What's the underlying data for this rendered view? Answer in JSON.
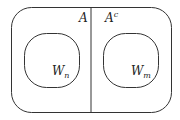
{
  "diagram": {
    "regions": {
      "left_label": "A",
      "right_label": "A",
      "right_label_sup": "c"
    },
    "sets": {
      "left": {
        "name": "W",
        "subscript": "n"
      },
      "right": {
        "name": "W",
        "subscript": "m"
      }
    },
    "colors": {
      "stroke": "#333333",
      "background": "#ffffff"
    }
  }
}
